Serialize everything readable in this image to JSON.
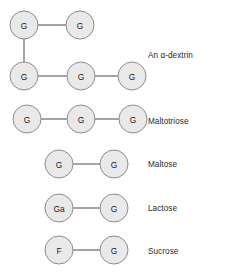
{
  "figure": {
    "title": "",
    "background_color": "#ffffff",
    "node": {
      "fill_color": "#e9e9e9",
      "stroke_color": "#8d8d8d",
      "radius": 14,
      "text_color": "#1a1a1a"
    },
    "bond": {
      "color": "#5a5a5a"
    },
    "label_color": "#2b2b2b",
    "rows": [
      {
        "id": "alpha-dextrin",
        "label": "An α-dextrin",
        "label_x": 148,
        "label_y": 52,
        "nodes": [
          {
            "id": "d1",
            "text": "G",
            "cx": 24,
            "cy": 25
          },
          {
            "id": "d2",
            "text": "G",
            "cx": 80,
            "cy": 25
          },
          {
            "id": "d3",
            "text": "G",
            "cx": 24,
            "cy": 76
          },
          {
            "id": "d4",
            "text": "G",
            "cx": 81,
            "cy": 76
          },
          {
            "id": "d5",
            "text": "G",
            "cx": 132,
            "cy": 76
          }
        ],
        "bonds": [
          {
            "from": "d1",
            "to": "d2"
          },
          {
            "from": "d1",
            "to": "d3"
          },
          {
            "from": "d3",
            "to": "d4"
          },
          {
            "from": "d4",
            "to": "d5"
          }
        ]
      },
      {
        "id": "maltotriose",
        "label": "Maltotriose",
        "label_x": 148,
        "label_y": 118,
        "nodes": [
          {
            "id": "m1",
            "text": "G",
            "cx": 27,
            "cy": 119
          },
          {
            "id": "m2",
            "text": "G",
            "cx": 81,
            "cy": 119
          },
          {
            "id": "m3",
            "text": "G",
            "cx": 133,
            "cy": 119
          }
        ],
        "bonds": [
          {
            "from": "m1",
            "to": "m2"
          },
          {
            "from": "m2",
            "to": "m3"
          }
        ]
      },
      {
        "id": "maltose",
        "label": "Maltose",
        "label_x": 148,
        "label_y": 161,
        "nodes": [
          {
            "id": "ma1",
            "text": "G",
            "cx": 59,
            "cy": 164
          },
          {
            "id": "ma2",
            "text": "G",
            "cx": 114,
            "cy": 164
          }
        ],
        "bonds": [
          {
            "from": "ma1",
            "to": "ma2"
          }
        ]
      },
      {
        "id": "lactose",
        "label": "Lactose",
        "label_x": 148,
        "label_y": 205,
        "nodes": [
          {
            "id": "l1",
            "text": "Ga",
            "cx": 59,
            "cy": 208
          },
          {
            "id": "l2",
            "text": "G",
            "cx": 114,
            "cy": 208
          }
        ],
        "bonds": [
          {
            "from": "l1",
            "to": "l2"
          }
        ]
      },
      {
        "id": "sucrose",
        "label": "Sucrose",
        "label_x": 148,
        "label_y": 248,
        "nodes": [
          {
            "id": "s1",
            "text": "F",
            "cx": 59,
            "cy": 250
          },
          {
            "id": "s2",
            "text": "G",
            "cx": 114,
            "cy": 250
          }
        ],
        "bonds": [
          {
            "from": "s1",
            "to": "s2"
          }
        ]
      }
    ]
  }
}
